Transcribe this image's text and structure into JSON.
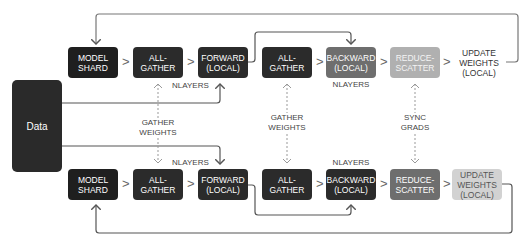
{
  "data_node": {
    "label": "Data"
  },
  "top_row": {
    "nodes": [
      {
        "label": "MODEL\nSHARD"
      },
      {
        "label": "ALL-\nGATHER"
      },
      {
        "label": "FORWARD\n(LOCAL)"
      },
      {
        "label": "ALL-\nGATHER"
      },
      {
        "label": "BACKWARD\n(LOCAL)"
      },
      {
        "label": "REDUCE-\nSCATTER"
      },
      {
        "label": "UPDATE\nWEIGHTS\n(LOCAL)"
      }
    ],
    "forward_loop_label": "NLAYERS",
    "backward_loop_label": "NLAYERS"
  },
  "bottom_row": {
    "nodes": [
      {
        "label": "MODEL\nSHARD"
      },
      {
        "label": "ALL-\nGATHER"
      },
      {
        "label": "FORWARD\n(LOCAL)"
      },
      {
        "label": "ALL-\nGATHER"
      },
      {
        "label": "BACKWARD\n(LOCAL)"
      },
      {
        "label": "REDUCE-\nSCATTER"
      },
      {
        "label": "UPDATE\nWEIGHTS\n(LOCAL)"
      }
    ],
    "forward_loop_label": "NLAYERS",
    "backward_loop_label": "NLAYERS"
  },
  "sync_labels": {
    "gather_weights_1": "GATHER\nWEIGHTS",
    "gather_weights_2": "GATHER\nWEIGHTS",
    "sync_grads": "SYNC\nGRADS"
  },
  "separator_glyph": ">",
  "colors": {
    "dark": "#2b2b2b",
    "mid": "#6e6e6e",
    "light": "#b0b0b0",
    "lighter": "#d2d2d2",
    "line": "#555555",
    "dotted": "#999999"
  }
}
